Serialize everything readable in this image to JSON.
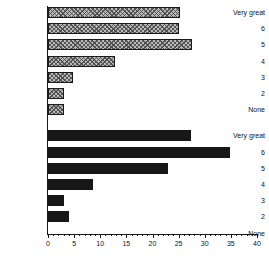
{
  "chart_data": {
    "type": "bar",
    "orientation": "horizontal",
    "title": "",
    "subtitle": "",
    "xlabel": "",
    "ylabel": "",
    "xlim": [
      0,
      40
    ],
    "grid": false,
    "legend": null,
    "x_major_ticks": [
      0,
      5,
      10,
      15,
      20,
      25,
      30,
      35,
      40
    ],
    "x_minor_tick_step": 1,
    "x_tick_labels": [
      "0",
      "5",
      "10",
      "15",
      "20",
      "25",
      "30",
      "35",
      "40"
    ],
    "categories": [
      "Very great",
      "6",
      "5",
      "4",
      "3",
      "2",
      "None"
    ],
    "series": [
      {
        "name": "Group A",
        "style": "hatched-gray",
        "fill": "#b9b9b9",
        "edge": "#1a1a1a",
        "values": [
          25.2,
          25.0,
          27.5,
          12.9,
          4.7,
          3.0,
          3.1
        ]
      },
      {
        "name": "Group B",
        "style": "solid-black",
        "fill": "#171717",
        "edge": "#171717",
        "values": [
          27.3,
          34.9,
          23.0,
          8.6,
          3.1,
          4.0,
          0.0
        ]
      }
    ]
  }
}
